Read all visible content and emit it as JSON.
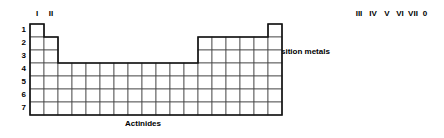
{
  "figure": {
    "kind": "periodic-table-schematic",
    "width": 444,
    "height": 138,
    "background_color": "#ffffff",
    "grid_line_color": "#4a4a4a",
    "outline_color": "#111111"
  },
  "group_labels": [
    {
      "text": "I",
      "col": 1,
      "x": 37,
      "y": 14
    },
    {
      "text": "II",
      "col": 2,
      "x": 51,
      "y": 14
    },
    {
      "text": "III",
      "col": 13,
      "x": 359,
      "y": 14
    },
    {
      "text": "IV",
      "col": 14,
      "x": 373,
      "y": 14
    },
    {
      "text": "V",
      "col": 15,
      "x": 387,
      "y": 14
    },
    {
      "text": "VI",
      "col": 16,
      "x": 399,
      "y": 14
    },
    {
      "text": "VII",
      "col": 17,
      "x": 411,
      "y": 14
    },
    {
      "text": "0",
      "col": 18,
      "x": 424,
      "y": 14
    }
  ],
  "period_labels": [
    {
      "text": "1",
      "row": 1,
      "y": 25
    },
    {
      "text": "2",
      "row": 2,
      "y": 38
    },
    {
      "text": "3",
      "row": 3,
      "y": 51
    },
    {
      "text": "4",
      "row": 4,
      "y": 64
    },
    {
      "text": "5",
      "row": 5,
      "y": 77
    },
    {
      "text": "6",
      "row": 6,
      "y": 90
    },
    {
      "text": "7",
      "row": 7,
      "y": 103
    }
  ],
  "region_labels": [
    {
      "text": "Transition metals",
      "x": 297,
      "y": 52
    },
    {
      "text": "Lanthanides",
      "x": 150,
      "y": 78
    },
    {
      "text": "Actinides",
      "x": 142,
      "y": 124
    }
  ],
  "chart_data": {
    "type": "table",
    "title": "",
    "periods": [
      1,
      2,
      3,
      4,
      5,
      6,
      7
    ],
    "groups": [
      "I",
      "II",
      "III",
      "IV",
      "V",
      "VI",
      "VII",
      "0"
    ],
    "regions": [
      "Transition metals",
      "Lanthanides",
      "Actinides"
    ],
    "cell_width": 14,
    "cell_height": 13,
    "origin_x": 30,
    "origin_y": 24,
    "columns_total": 18,
    "row_cell_spans": [
      {
        "period": 1,
        "segments": [
          [
            1,
            1
          ],
          [
            18,
            18
          ]
        ]
      },
      {
        "period": 2,
        "segments": [
          [
            1,
            2
          ],
          [
            13,
            18
          ]
        ]
      },
      {
        "period": 3,
        "segments": [
          [
            1,
            2
          ],
          [
            13,
            18
          ]
        ]
      },
      {
        "period": 4,
        "segments": [
          [
            1,
            18
          ]
        ]
      },
      {
        "period": 5,
        "segments": [
          [
            1,
            18
          ]
        ]
      },
      {
        "period": 6,
        "segments": [
          [
            1,
            18
          ]
        ]
      },
      {
        "period": 7,
        "segments": [
          [
            1,
            18
          ]
        ]
      }
    ],
    "staircase_points": [
      [
        198,
        2
      ],
      [
        198,
        3
      ],
      [
        199,
        3
      ],
      [
        199,
        4
      ],
      [
        200,
        4
      ],
      [
        200,
        5
      ],
      [
        201,
        5
      ],
      [
        201,
        6
      ],
      [
        202,
        6
      ],
      [
        202,
        7
      ]
    ]
  }
}
